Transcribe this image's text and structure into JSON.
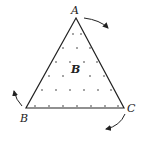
{
  "diagram": {
    "type": "triangle-in-magnetic-field",
    "vertices": {
      "A": {
        "label": "A",
        "x": 76,
        "y": 18
      },
      "B": {
        "label": "B",
        "x": 26,
        "y": 108
      },
      "C": {
        "label": "C",
        "x": 124,
        "y": 108
      }
    },
    "field_label": "B",
    "field_symbol": "dot-out-of-page",
    "rotation_arrows": [
      "near-A-clockwise",
      "near-B",
      "near-C"
    ],
    "colors": {
      "stroke": "#222222",
      "dot": "#333333",
      "background": "#ffffff"
    }
  }
}
